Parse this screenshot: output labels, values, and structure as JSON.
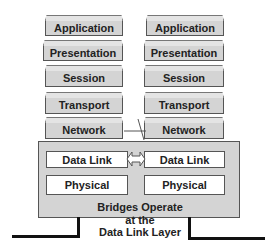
{
  "left_stack": [
    "Application",
    "Presentation",
    "Session",
    "Transport",
    "Network"
  ],
  "right_stack": [
    "Application",
    "Presentation",
    "Session",
    "Transport",
    "Network"
  ],
  "bridge": {
    "left": [
      "Data Link",
      "Physical"
    ],
    "right": [
      "Data Link",
      "Physical"
    ],
    "arrow": "bidirectional-arrow"
  },
  "caption": [
    "Bridges Operate",
    "at the",
    "Data Link Layer"
  ]
}
